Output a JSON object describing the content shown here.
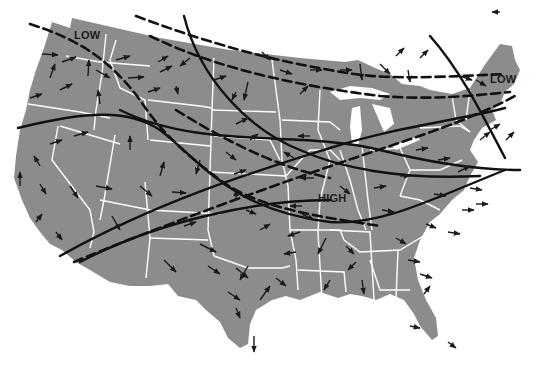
{
  "map": {
    "title": "United States weather map",
    "colors": {
      "land": "#8c8c8c",
      "borders": "#ffffff",
      "water": "#ffffff",
      "lines": "#111111",
      "arrows": "#1a1a1a"
    },
    "pressure_labels": [
      {
        "id": "low-west",
        "text": "LOW",
        "x": 76,
        "y": 34
      },
      {
        "id": "low-east",
        "text": "LOW",
        "x": 490,
        "y": 78
      },
      {
        "id": "high-central",
        "text": "HIGH",
        "x": 320,
        "y": 197
      }
    ],
    "line_types": [
      "solid-front",
      "dashed-front"
    ]
  }
}
